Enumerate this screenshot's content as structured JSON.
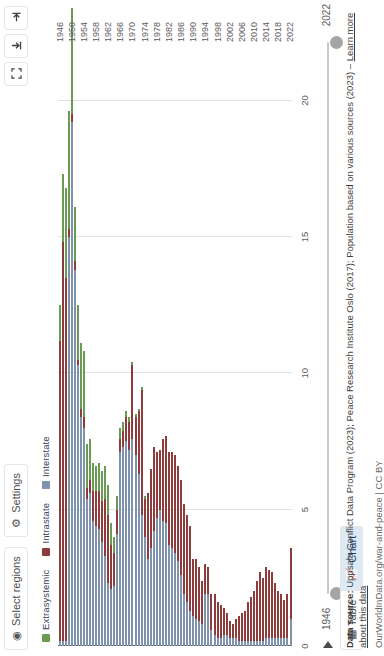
{
  "controls": {
    "select_regions": {
      "label": "Select regions",
      "icon": "globe-icon"
    },
    "settings": {
      "label": "Settings",
      "icon": "gear-icon"
    }
  },
  "top_right_icons": [
    {
      "name": "expand-icon",
      "title": "Expand"
    },
    {
      "name": "download-icon",
      "title": "Download"
    },
    {
      "name": "share-icon",
      "title": "Share"
    }
  ],
  "tabs": [
    {
      "label": "Table",
      "icon": "table-icon",
      "active": false
    },
    {
      "label": "Chart",
      "icon": "chart-icon",
      "active": true
    }
  ],
  "timeline": {
    "min_label": "1946",
    "max_label": "2022",
    "play_icon": "play-icon"
  },
  "footer": {
    "source_prefix": "Data source:",
    "source_text": " Uppsala Conflict Data Program (2023); Peace Research Institute Oslo (2017); Population based on various sources (2023) – ",
    "learn_more": "Learn more about this data",
    "license": "OurWorldInData.org/war-and-peace | CC BY"
  },
  "colors": {
    "extrasystemic": "#6a9b55",
    "intrastate": "#8d3b3b",
    "interstate": "#7f93ae",
    "grid": "#e2e2e2",
    "axis": "#5b5b5b",
    "tab_active_bg": "#dbeaf5"
  },
  "chart_data": {
    "type": "bar",
    "orientation": "horizontal",
    "title": "",
    "xlabel": "",
    "ylabel": "",
    "xlim": [
      0,
      22
    ],
    "grid": true,
    "legend_position": "top-left",
    "xticks": [
      0,
      5,
      10,
      15,
      20
    ],
    "xtick_labels": [
      "0",
      "5",
      "10",
      "15",
      "20"
    ],
    "ytick_labels": [
      "1946",
      "1950",
      "1954",
      "1958",
      "1962",
      "1966",
      "1970",
      "1974",
      "1978",
      "1982",
      "1986",
      "1990",
      "1994",
      "1998",
      "2002",
      "2006",
      "2010",
      "2014",
      "2018",
      "2022"
    ],
    "series": [
      {
        "name": "Extrasystemic",
        "color": "#6a9b55"
      },
      {
        "name": "Intrastate",
        "color": "#8d3b3b"
      },
      {
        "name": "Interstate",
        "color": "#7f93ae"
      }
    ],
    "categories": [
      "1946",
      "1947",
      "1948",
      "1949",
      "1950",
      "1951",
      "1952",
      "1953",
      "1954",
      "1955",
      "1956",
      "1957",
      "1958",
      "1959",
      "1960",
      "1961",
      "1962",
      "1963",
      "1964",
      "1965",
      "1966",
      "1967",
      "1968",
      "1969",
      "1970",
      "1971",
      "1972",
      "1973",
      "1974",
      "1975",
      "1976",
      "1977",
      "1978",
      "1979",
      "1980",
      "1981",
      "1982",
      "1983",
      "1984",
      "1985",
      "1986",
      "1987",
      "1988",
      "1989",
      "1990",
      "1991",
      "1992",
      "1993",
      "1994",
      "1995",
      "1996",
      "1997",
      "1998",
      "1999",
      "2000",
      "2001",
      "2002",
      "2003",
      "2004",
      "2005",
      "2006",
      "2007",
      "2008",
      "2009",
      "2010",
      "2011",
      "2012",
      "2013",
      "2014",
      "2015",
      "2016",
      "2017",
      "2018",
      "2019",
      "2020",
      "2021",
      "2022"
    ],
    "values": {
      "Interstate": [
        0.2,
        0.2,
        0.2,
        15.0,
        19.2,
        13.8,
        10.3,
        8.4,
        8.0,
        5.4,
        5.6,
        4.6,
        4.4,
        4.3,
        3.8,
        3.3,
        2.3,
        2.1,
        2.2,
        4.1,
        7.1,
        7.3,
        7.5,
        7.2,
        7.6,
        7.0,
        6.3,
        4.8,
        4.0,
        3.2,
        3.6,
        4.2,
        4.7,
        5.0,
        4.6,
        4.5,
        3.7,
        3.6,
        3.4,
        3.1,
        2.6,
        1.9,
        1.6,
        1.3,
        1.1,
        1.0,
        0.9,
        0.8,
        1.9,
        1.9,
        0.6,
        0.4,
        0.3,
        0.3,
        0.4,
        0.4,
        0.3,
        0.3,
        0.3,
        0.2,
        0.2,
        0.2,
        0.2,
        0.2,
        0.2,
        0.2,
        0.2,
        0.2,
        0.3,
        0.3,
        0.3,
        0.3,
        0.3,
        0.3,
        0.3,
        0.3,
        1.0
      ],
      "Intrastate": [
        11.0,
        14.6,
        13.3,
        0.3,
        0.3,
        0.3,
        0.2,
        0.3,
        0.4,
        0.4,
        0.5,
        1.1,
        1.3,
        1.4,
        1.5,
        2.1,
        2.5,
        1.6,
        1.2,
        0.9,
        0.5,
        0.6,
        0.9,
        1.0,
        2.7,
        1.4,
        2.3,
        4.6,
        1.4,
        2.4,
        2.9,
        3.1,
        2.4,
        2.2,
        3.0,
        3.2,
        3.4,
        3.5,
        3.6,
        3.5,
        3.5,
        3.3,
        3.2,
        3.1,
        2.1,
        2.2,
        2.0,
        1.6,
        1.1,
        1.0,
        1.3,
        1.5,
        1.3,
        1.2,
        1.0,
        0.8,
        0.6,
        0.5,
        0.7,
        0.9,
        1.0,
        1.1,
        1.4,
        1.6,
        1.8,
        2.2,
        2.5,
        2.3,
        2.6,
        2.5,
        2.4,
        2.0,
        1.7,
        1.6,
        1.4,
        1.6,
        2.6
      ],
      "Extrasystemic": [
        1.3,
        2.5,
        3.3,
        4.3,
        3.9,
        2.0,
        2.0,
        2.4,
        2.4,
        1.6,
        1.5,
        1.0,
        0.9,
        1.0,
        1.1,
        1.2,
        1.1,
        0.8,
        0.6,
        0.5,
        0.4,
        0.3,
        0.2,
        0.2,
        0.1,
        0.1,
        0.1,
        0.1,
        0.1,
        0.0,
        0.0,
        0.0,
        0.0,
        0.0,
        0.0,
        0.0,
        0.0,
        0.0,
        0.0,
        0.0,
        0.0,
        0.0,
        0.0,
        0.0,
        0.0,
        0.0,
        0.0,
        0.0,
        0.0,
        0.0,
        0.0,
        0.0,
        0.0,
        0.0,
        0.0,
        0.0,
        0.0,
        0.0,
        0.0,
        0.0,
        0.0,
        0.0,
        0.0,
        0.0,
        0.0,
        0.0,
        0.0,
        0.0,
        0.0,
        0.0,
        0.0,
        0.0,
        0.0,
        0.0,
        0.0,
        0.0,
        0.0
      ]
    }
  }
}
